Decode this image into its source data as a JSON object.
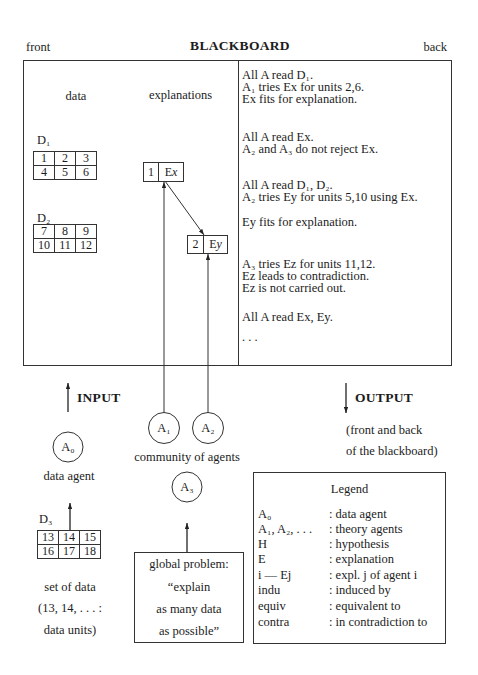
{
  "header": {
    "left": "front",
    "title": "BLACKBOARD",
    "right": "back"
  },
  "board": {
    "columns": {
      "data": "data",
      "explanations": "explanations"
    },
    "datasets": [
      {
        "label": "D₁",
        "cells": [
          [
            "1",
            "2",
            "3"
          ],
          [
            "4",
            "5",
            "6"
          ]
        ]
      },
      {
        "label": "D₂",
        "cells": [
          [
            "7",
            "8",
            "9"
          ],
          [
            "10",
            "11",
            "12"
          ]
        ]
      }
    ],
    "explanations": [
      {
        "agent": "1",
        "letter": "E",
        "var": "x"
      },
      {
        "agent": "2",
        "letter": "E",
        "var": "y"
      }
    ],
    "log": [
      "All A read D₁.",
      "A₁ tries Ex for units 2,6.",
      "Ex fits for explanation.",
      "All A read Ex.",
      "A₂ and A₃ do not reject Ex.",
      "All A read D₁, D₂.",
      "A₂ tries Ey for units 5,10 using Ex.",
      "Ey fits for explanation.",
      "A₃ tries Ez for units 11,12.",
      "Ez leads to contradiction.",
      "Ez is not carried out.",
      "All A read Ex, Ey.",
      ". . ."
    ]
  },
  "input": {
    "label": "INPUT"
  },
  "output": {
    "label": "OUTPUT",
    "note": [
      "(front and back",
      "of the blackboard)"
    ]
  },
  "agents": {
    "data_agent": {
      "symbol": "A₀",
      "caption": "data agent"
    },
    "community": {
      "caption": "community of agents",
      "members": [
        "A₁",
        "A₂",
        "A₃"
      ]
    }
  },
  "data_source": {
    "label": "D₃",
    "cells": [
      [
        "13",
        "14",
        "15"
      ],
      [
        "16",
        "17",
        "18"
      ]
    ],
    "caption": [
      "set of data",
      "(13, 14, . . . :",
      "data units)"
    ]
  },
  "global_problem": {
    "lines": [
      "global problem:",
      "“explain",
      "as many data",
      "as possible”"
    ]
  },
  "legend": {
    "title": "Legend",
    "rows": [
      {
        "symbol": "A₀",
        "meaning": ": data agent"
      },
      {
        "symbol": "A₁, A₂, . . .",
        "meaning": ": theory agents"
      },
      {
        "symbol": "H",
        "meaning": ": hypothesis"
      },
      {
        "symbol": "E",
        "meaning": ": explanation"
      },
      {
        "symbol": "i — Ej",
        "meaning": ": expl. j of agent i"
      },
      {
        "symbol": "indu",
        "meaning": ": induced by"
      },
      {
        "symbol": "equiv",
        "meaning": ": equivalent to"
      },
      {
        "symbol": "contra",
        "meaning": ": in contradiction to"
      }
    ]
  },
  "colors": {
    "ink": "#1c1c1c",
    "line": "#333333",
    "background": "#ffffff"
  }
}
